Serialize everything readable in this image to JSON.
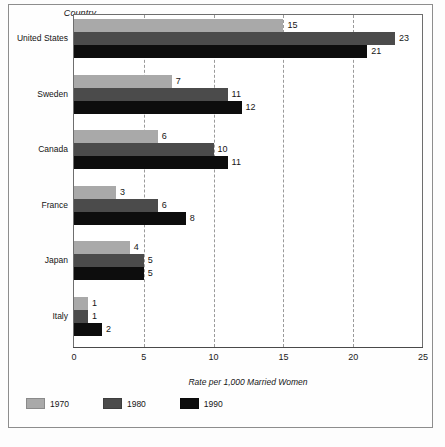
{
  "chart_data": {
    "type": "bar",
    "orientation": "horizontal",
    "title": "",
    "xlabel": "Rate per 1,000 Married Women",
    "ylabel": "Country",
    "categories": [
      "United States",
      "Sweden",
      "Canada",
      "France",
      "Japan",
      "Italy"
    ],
    "series": [
      {
        "name": "1970",
        "color": "#a9a9a9",
        "values": [
          15,
          7,
          6,
          3,
          4,
          1
        ]
      },
      {
        "name": "1980",
        "color": "#4b4b4b",
        "values": [
          23,
          11,
          10,
          6,
          5,
          1
        ]
      },
      {
        "name": "1990",
        "color": "#0d0d0d",
        "values": [
          21,
          12,
          11,
          8,
          5,
          2
        ]
      }
    ],
    "xlim": [
      0,
      25
    ],
    "xticks": [
      0,
      5,
      10,
      15,
      20,
      25
    ],
    "xtick_labels": [
      "0",
      "5",
      "10",
      "15",
      "20",
      "25"
    ],
    "gridlines": [
      5,
      10,
      15,
      20
    ],
    "grid": true,
    "grid_style": "dashed-vertical",
    "legend_position": "bottom-left",
    "data_labels": true
  },
  "legend": {
    "items": [
      {
        "label": "1970",
        "swatch": "y1970"
      },
      {
        "label": "1980",
        "swatch": "y1980"
      },
      {
        "label": "1990",
        "swatch": "y1990"
      }
    ]
  }
}
